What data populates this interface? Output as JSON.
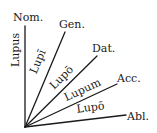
{
  "diagram": {
    "origin": {
      "x": 25,
      "y": 127
    },
    "line_color": "#1a1a1a",
    "branches": [
      {
        "case": "Nom.",
        "form": "Lupus"
      },
      {
        "case": "Gen.",
        "form": "Lupī"
      },
      {
        "case": "Dat.",
        "form": "Lupō"
      },
      {
        "case": "Acc.",
        "form": "Lupum"
      },
      {
        "case": "Abl.",
        "form": "Lupō"
      }
    ]
  }
}
